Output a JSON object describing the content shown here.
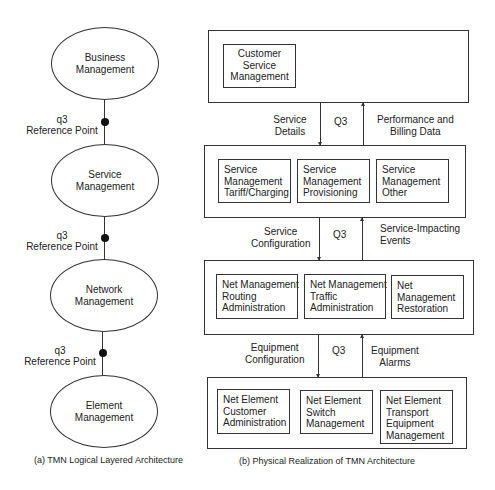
{
  "left": {
    "layers": [
      {
        "line1": "Business",
        "line2": "Management"
      },
      {
        "line1": "Service",
        "line2": "Management"
      },
      {
        "line1": "Network",
        "line2": "Management"
      },
      {
        "line1": "Element",
        "line2": "Management"
      }
    ],
    "reference_points": [
      {
        "line1": "q3",
        "line2": "Reference Point"
      },
      {
        "line1": "q3",
        "line2": "Reference Point"
      },
      {
        "line1": "q3",
        "line2": "Reference Point"
      }
    ],
    "caption": "(a) TMN Logical Layered Architecture"
  },
  "right": {
    "layer1": {
      "boxes": [
        {
          "lines": [
            "Customer",
            "Service",
            "Management"
          ]
        }
      ]
    },
    "link1": {
      "down": [
        "Service",
        "Details"
      ],
      "interface": "Q3",
      "up": [
        "Performance and",
        "Billing Data"
      ]
    },
    "layer2": {
      "boxes": [
        {
          "lines": [
            "Service",
            "Management",
            "Tariff/Charging"
          ]
        },
        {
          "lines": [
            "Service",
            "Management",
            "Provisioning"
          ]
        },
        {
          "lines": [
            "Service",
            "Management",
            "Other"
          ]
        }
      ]
    },
    "link2": {
      "down": [
        "Service",
        "Configuration"
      ],
      "interface": "Q3",
      "up": [
        "Service-Impacting",
        "Events"
      ]
    },
    "layer3": {
      "boxes": [
        {
          "lines": [
            "Net Management",
            "Routing",
            "Administration"
          ]
        },
        {
          "lines": [
            "Net Management",
            "Traffic",
            "Administration"
          ]
        },
        {
          "lines": [
            "Net",
            "Management",
            "Restoration"
          ]
        }
      ]
    },
    "link3": {
      "down": [
        "Equipment",
        "Configuration"
      ],
      "interface": "Q3",
      "up": [
        "Equipment",
        "Alarms"
      ]
    },
    "layer4": {
      "boxes": [
        {
          "lines": [
            "Net Element",
            "Customer",
            "Administration"
          ]
        },
        {
          "lines": [
            "Net Element",
            "Switch",
            "Management"
          ]
        },
        {
          "lines": [
            "Net Element",
            "Transport",
            "Equipment",
            "Management"
          ]
        }
      ]
    },
    "caption": "(b) Physical Realization of TMN Architecture"
  }
}
